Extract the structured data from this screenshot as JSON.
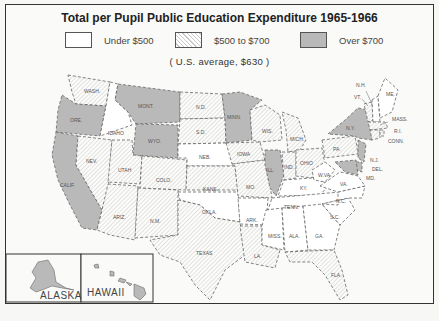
{
  "title": "Total per Pupil Public Education Expenditure 1965-1966",
  "legend": [
    {
      "label": "Under $500",
      "fill": "white"
    },
    {
      "label": "$500 to $700",
      "fill": "hatched"
    },
    {
      "label": "Over $700",
      "fill": "gray"
    }
  ],
  "average_note": "( U.S. average, $630 )",
  "colors": {
    "over_700": "#b9b9b9",
    "mid_hatch": "#c9c9c9",
    "under_500": "#ffffff",
    "border": "#333333"
  },
  "insets": {
    "alaska": "ALASKA",
    "hawaii": "HAWAII"
  },
  "states": {
    "over_700": [
      "WASH.?",
      "ORE.",
      "CALIF.",
      "MONT.",
      "WYO.",
      "MINN.",
      "ILL.",
      "N.Y.",
      "N.J.",
      "DEL.",
      "MD.",
      "ALASKA",
      "HAWAII"
    ],
    "mid_500_700": [
      "WASH.",
      "NEV.",
      "UTAH",
      "ARIZ.",
      "COLO.",
      "N.M.",
      "N.D.",
      "S.D.",
      "KANS.",
      "TEXAS",
      "IOWA",
      "MO.",
      "WIS.",
      "MICH.",
      "IND.",
      "OHIO",
      "PA.",
      "VT.",
      "MASS.",
      "R.I.",
      "CONN.",
      "LA.",
      "FLA."
    ],
    "under_500": [
      "IDAHO",
      "NEB.",
      "OKLA.",
      "ARK.",
      "KY.",
      "TENN.",
      "MISS.",
      "ALA.",
      "GA.",
      "S.C.",
      "N.C.",
      "VA.",
      "W.VA.",
      "N.H.",
      "ME."
    ]
  },
  "labels": {
    "wash": "WASH.",
    "ore": "ORE.",
    "calif": "CALIF.",
    "idaho": "IDAHO",
    "nev": "NEV.",
    "mont": "MONT.",
    "wyo": "WYO.",
    "utah": "UTAH",
    "ariz": "ARIZ.",
    "colo": "COLO.",
    "nm": "N.M.",
    "nd": "N.D.",
    "sd": "S.D.",
    "neb": "NEB.",
    "kans": "KANS.",
    "okla": "OKLA.",
    "texas": "TEXAS",
    "minn": "MINN.",
    "iowa": "IOWA",
    "mo": "MO.",
    "ark": "ARK.",
    "la": "LA.",
    "wis": "WIS.",
    "ill": "ILL.",
    "mich": "MICH.",
    "ind": "IND.",
    "ohio": "OHIO",
    "ky": "KY.",
    "tenn": "TENN.",
    "miss": "MISS.",
    "ala": "ALA.",
    "ga": "GA.",
    "fla": "FLA.",
    "sc": "S.C.",
    "nc": "N.C.",
    "va": "VA.",
    "wva": "W.VA.",
    "pa": "PA.",
    "ny": "N.Y.",
    "nj": "N.J.",
    "del": "DEL.",
    "md": "MD.",
    "vt": "VT.",
    "nh": "N.H.",
    "me": "ME.",
    "mass": "MASS.",
    "ri": "R.I.",
    "conn": "CONN."
  }
}
